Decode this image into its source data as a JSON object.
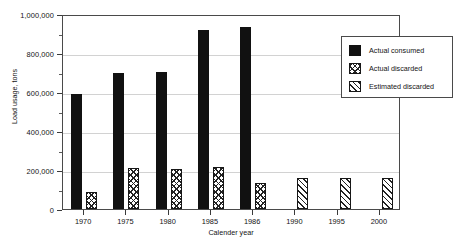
{
  "chart_data": {
    "type": "bar",
    "title": "",
    "xlabel": "Calender year",
    "ylabel": "Load usage, tons",
    "categories": [
      "1970",
      "1975",
      "1980",
      "1985",
      "1986",
      "1990",
      "1995",
      "2000"
    ],
    "ylim": [
      0,
      1000000
    ],
    "ytick_values": [
      0,
      200000,
      400000,
      600000,
      800000,
      1000000
    ],
    "ytick_labels": [
      "0",
      "200,000",
      "400,000",
      "600,000",
      "800,000",
      "1,000,000"
    ],
    "grid": true,
    "legend_position": "top-right",
    "series": [
      {
        "name": "Actual consumed",
        "pattern": "solid-black",
        "values": [
          590000,
          695000,
          705000,
          920000,
          935000,
          null,
          null,
          null
        ]
      },
      {
        "name": "Actual discarded",
        "pattern": "cross-hatch",
        "values": [
          85000,
          208000,
          203000,
          215000,
          135000,
          null,
          null,
          null
        ]
      },
      {
        "name": "Estimated discarded",
        "pattern": "diagonal-hatch",
        "values": [
          null,
          null,
          null,
          null,
          null,
          160000,
          160000,
          160000
        ]
      }
    ]
  },
  "legend": {
    "items": [
      {
        "label": "Actual consumed"
      },
      {
        "label": "Actual discarded"
      },
      {
        "label": "Estimated discarded"
      }
    ]
  }
}
